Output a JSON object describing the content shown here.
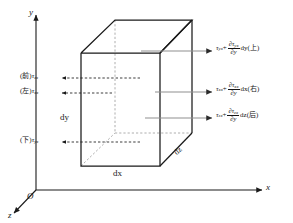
{
  "figure": {
    "title_type": "3d-stress-element-diagram",
    "axes": {
      "y_label": "y",
      "x_label": "x",
      "z_label": "z",
      "origin_label": "O"
    },
    "dimensions": {
      "dx": "dx",
      "dy": "dy",
      "dz": "dz"
    },
    "right_labels": [
      {
        "id": "top-face",
        "base": "τ",
        "base_sub": "yx",
        "plus": "+",
        "numerator": "∂τ",
        "numerator_sub": "yx",
        "denominator": "∂y",
        "differential": "dy",
        "face": "(上)"
      },
      {
        "id": "right-face",
        "base": "τ",
        "base_sub": "xx",
        "plus": "+",
        "numerator": "∂τ",
        "numerator_sub": "xx",
        "denominator": "∂y",
        "differential": "dx",
        "face": "(右)"
      },
      {
        "id": "back-face",
        "base": "τ",
        "base_sub": "zx",
        "plus": "+",
        "numerator": "∂τ",
        "numerator_sub": "zx",
        "denominator": "∂y",
        "differential": "dz",
        "face": "(后)"
      }
    ],
    "left_labels": [
      {
        "id": "front-face",
        "face": "(前)",
        "base": "τ",
        "base_sub": "zx"
      },
      {
        "id": "left-face",
        "face": "(左)",
        "base": "τ",
        "base_sub": "xx"
      },
      {
        "id": "bottom-face",
        "face": "(下)",
        "base": "τ",
        "base_sub": "yx"
      }
    ],
    "colors": {
      "stroke": "#1a1a1a",
      "hidden_stroke": "#8c8c8c",
      "arrow_gray": "#8a8a8a",
      "background": "#ffffff"
    }
  }
}
